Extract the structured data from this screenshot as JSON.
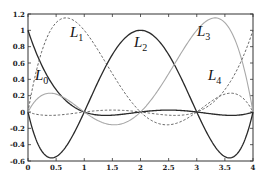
{
  "chart_data": {
    "type": "line",
    "title": "",
    "xlabel": "",
    "ylabel": "",
    "xlim": [
      0,
      4
    ],
    "ylim": [
      -0.6,
      1.2
    ],
    "grid": false,
    "x_ticks": [
      "0",
      "0.5",
      "1",
      "1.5",
      "2",
      "2.5",
      "3",
      "3.5",
      "4"
    ],
    "y_ticks": [
      "-0.6",
      "-0.4",
      "-0.2",
      "0",
      "0.2",
      "0.4",
      "0.6",
      "0.8",
      "1",
      "1.2"
    ],
    "nodes": [
      0,
      1,
      2,
      3,
      4
    ],
    "series": [
      {
        "name": "L0",
        "style": "solid-dark",
        "x": [
          0,
          0.25,
          0.5,
          0.75,
          1,
          1.5,
          2,
          2.5,
          3,
          3.5,
          4
        ],
        "values": [
          1,
          0.31,
          -0.55,
          -0.39,
          0,
          0.04,
          0,
          -0.02,
          0,
          0.02,
          0
        ]
      },
      {
        "name": "L1",
        "style": "dashed",
        "x": [
          0,
          0.5,
          0.75,
          1,
          1.5,
          2,
          2.5,
          3,
          3.5,
          4
        ],
        "values": [
          0,
          1.09,
          1.13,
          1,
          0.31,
          0,
          -0.08,
          0,
          0.14,
          0
        ]
      },
      {
        "name": "L2",
        "style": "solid-dark",
        "x": [
          0,
          0.5,
          1,
          1.5,
          2,
          2.5,
          3,
          3.5,
          4
        ],
        "values": [
          0,
          -0.55,
          0,
          0.66,
          1,
          0.66,
          0,
          -0.55,
          0
        ]
      },
      {
        "name": "L3",
        "style": "solid-light",
        "x": [
          0,
          0.5,
          1,
          1.5,
          2,
          2.5,
          3,
          3.25,
          3.5,
          4
        ],
        "values": [
          0,
          0.22,
          0,
          -0.16,
          0,
          0.55,
          1,
          1.13,
          1.09,
          0
        ]
      },
      {
        "name": "L4",
        "style": "dashed",
        "x": [
          0,
          0.5,
          1,
          1.5,
          2,
          2.5,
          3,
          3.5,
          4
        ],
        "values": [
          0,
          -0.03,
          0,
          0.03,
          0,
          -0.08,
          0,
          0.31,
          1
        ]
      }
    ],
    "annotations": [
      {
        "text": "L",
        "sub": "0",
        "x": 0.38,
        "y": 0.42
      },
      {
        "text": "L",
        "sub": "1",
        "x": 0.8,
        "y": 1.0
      },
      {
        "text": "L",
        "sub": "2",
        "x": 2.0,
        "y": 0.92
      },
      {
        "text": "L",
        "sub": "3",
        "x": 3.05,
        "y": 1.0
      },
      {
        "text": "L",
        "sub": "4",
        "x": 3.1,
        "y": 0.38
      }
    ],
    "legend": "none (inline labels)"
  },
  "labels": {
    "l0": "L",
    "l0_sub": "0",
    "l1": "L",
    "l1_sub": "1",
    "l2": "L",
    "l2_sub": "2",
    "l3": "L",
    "l3_sub": "3",
    "l4": "L",
    "l4_sub": "4"
  },
  "axes": {
    "x_ticks": [
      "0",
      "0.5",
      "1",
      "1.5",
      "2",
      "2.5",
      "3",
      "3.5",
      "4"
    ],
    "y_ticks": [
      "-0.6",
      "-0.4",
      "-0.2",
      "0",
      "0.2",
      "0.4",
      "0.6",
      "0.8",
      "1",
      "1.2"
    ]
  },
  "colors": {
    "dark": "#2a2a2a",
    "light": "#a8a8a8",
    "dashed": "#555555",
    "axis": "#333333"
  }
}
